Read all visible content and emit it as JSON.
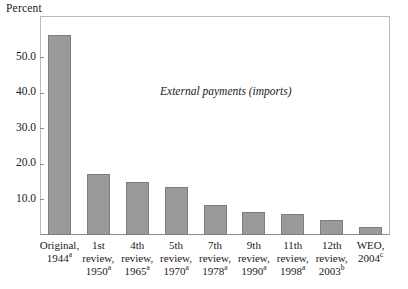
{
  "chart_data": {
    "type": "bar",
    "title": "",
    "subtitle": "",
    "xlabel": "",
    "ylabel": "Percent",
    "ylim": [
      0,
      60
    ],
    "yticks": [
      "10.0",
      "20.0",
      "30.0",
      "40.0",
      "50.0"
    ],
    "ytick_values": [
      10,
      20,
      30,
      40,
      50
    ],
    "grid": false,
    "legend": "none",
    "annotations": [
      {
        "text": "External payments (imports)",
        "style": "italic"
      }
    ],
    "categories": [
      "Original, 1944",
      "1st review, 1950",
      "4th review, 1965",
      "5th review, 1970",
      "7th review, 1978",
      "9th review, 1990",
      "11th review, 1998",
      "12th review, 2003",
      "WEO, 2004"
    ],
    "category_labels": [
      {
        "line1": "Original,",
        "line2": "1944",
        "line2_sup": "a",
        "line3": "",
        "line3_sup": ""
      },
      {
        "line1": "1st",
        "line2": "review,",
        "line2_sup": "",
        "line3": "1950",
        "line3_sup": "a"
      },
      {
        "line1": "4th",
        "line2": "review,",
        "line2_sup": "",
        "line3": "1965",
        "line3_sup": "a"
      },
      {
        "line1": "5th",
        "line2": "review,",
        "line2_sup": "",
        "line3": "1970",
        "line3_sup": "a"
      },
      {
        "line1": "7th",
        "line2": "review,",
        "line2_sup": "",
        "line3": "1978",
        "line3_sup": "a"
      },
      {
        "line1": "9th",
        "line2": "review,",
        "line2_sup": "",
        "line3": "1990",
        "line3_sup": "a"
      },
      {
        "line1": "11th",
        "line2": "review,",
        "line2_sup": "",
        "line3": "1998",
        "line3_sup": "a"
      },
      {
        "line1": "12th",
        "line2": "review,",
        "line2_sup": "",
        "line3": "2003",
        "line3_sup": "b"
      },
      {
        "line1": "WEO,",
        "line2": "2004",
        "line2_sup": "c",
        "line3": "",
        "line3_sup": ""
      }
    ],
    "values": [
      56.4,
      17.2,
      14.9,
      13.5,
      8.5,
      6.5,
      5.9,
      4.2,
      2.2
    ],
    "bar_color": "#9a9a9a",
    "bar_edge_color": "#7d7d7d",
    "frame_color": "#b9b9b9",
    "axis_color": "#8e8e8e",
    "text_color": "#1a1a1a"
  }
}
